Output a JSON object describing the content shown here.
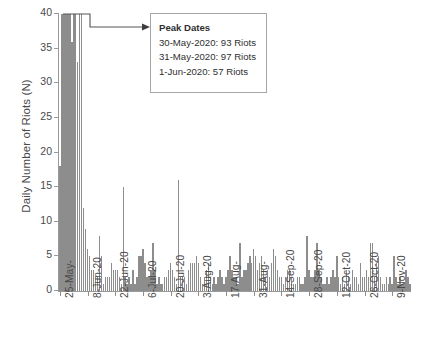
{
  "chart_data": {
    "type": "bar",
    "title": "",
    "xlabel": "",
    "ylabel": "Daily Number of Riots (N)",
    "ylim": [
      0,
      40
    ],
    "yticks": [
      0,
      5,
      10,
      15,
      20,
      25,
      30,
      35,
      40
    ],
    "grid": false,
    "legend": null,
    "bar_color": "#8d8d8d",
    "axis_color": "#9a9a9a",
    "clipped_note": "Bars for 30-May-2020, 31-May-2020 and 1-Jun-2020 exceed the 40 axis maximum and are clipped at the top of the plot.",
    "x_start": "25-May-2020",
    "x_end": "18-Nov-2020",
    "xtick_labels": [
      "25-May-",
      "8-Jun-20",
      "22-Jun-20",
      "6-Jul-20",
      "20-Jul-20",
      "3-Aug-20",
      "17-Aug-",
      "31-Aug-",
      "14-Sep-20",
      "28-Sep-20",
      "12-Oct-20",
      "26-Oct-20",
      "9-Nov-20"
    ],
    "xtick_indices": [
      0,
      14,
      28,
      42,
      56,
      70,
      84,
      98,
      112,
      126,
      140,
      154,
      168
    ],
    "values": [
      18,
      40,
      40,
      40,
      40,
      40,
      36,
      40,
      40,
      33,
      40,
      40,
      12,
      9,
      6,
      5,
      3,
      3,
      2,
      2,
      8,
      5,
      1,
      2,
      2,
      2,
      4,
      3,
      3,
      3,
      2,
      1,
      15,
      2,
      1,
      2,
      1,
      3,
      1,
      2,
      5,
      5,
      6,
      4,
      2,
      2,
      3,
      7,
      3,
      1,
      2,
      1,
      1,
      2,
      2,
      3,
      4,
      3,
      2,
      1,
      16,
      2,
      2,
      2,
      1,
      3,
      4,
      4,
      4,
      5,
      4,
      2,
      1,
      2,
      3,
      4,
      2,
      1,
      2,
      1,
      2,
      3,
      2,
      1,
      2,
      3,
      5,
      3,
      2,
      2,
      1,
      7,
      2,
      3,
      3,
      4,
      5,
      4,
      6,
      5,
      3,
      4,
      5,
      3,
      2,
      3,
      2,
      4,
      6,
      5,
      3,
      2,
      2,
      1,
      2,
      3,
      3,
      2,
      1,
      1,
      2,
      2,
      1,
      1,
      2,
      8,
      3,
      2,
      2,
      3,
      7,
      3,
      2,
      1,
      1,
      2,
      1,
      2,
      3,
      2,
      5,
      2,
      1,
      2,
      1,
      3,
      2,
      1,
      3,
      2,
      2,
      1,
      4,
      2,
      2,
      3,
      2,
      7,
      7,
      2,
      4,
      5,
      2,
      1,
      1,
      2,
      1,
      2,
      1,
      5,
      2,
      1,
      2,
      1,
      1,
      3,
      2,
      1
    ]
  },
  "annotation": {
    "title": "Peak Dates",
    "lines": [
      "30-May-2020: 93 Riots",
      "31-May-2020: 97 Riots",
      "1-Jun-2020: 57 Riots"
    ]
  }
}
